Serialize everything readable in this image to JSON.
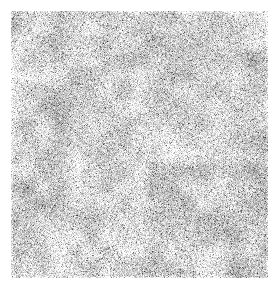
{
  "image": {
    "kind": "grayscale-noise-texture",
    "canvas_width": 280,
    "canvas_height": 290,
    "background_color": "#ffffff",
    "caption": "",
    "title": ""
  },
  "noise_field": {
    "label": "grayscale random noise field",
    "x": 11,
    "y": 11,
    "width": 257,
    "height": 267,
    "seed": 20240617,
    "grain_size": 1,
    "mean_level": 216,
    "contrast_spread": 54,
    "dark_value": "#303030",
    "light_value": "#fafafa",
    "mid_value": "#d8d8d8",
    "mottle_scale": 16,
    "mottle_amplitude": 26,
    "mottle_scale_coarse": 48,
    "mottle_amplitude_coarse": 14,
    "dark_speck_probability": 0.16,
    "dark_speck_strength": 95,
    "edge_fade_px": 2
  },
  "margins": {
    "label": "white page margin",
    "left": 11,
    "top": 11,
    "right": 12,
    "bottom": 12
  }
}
